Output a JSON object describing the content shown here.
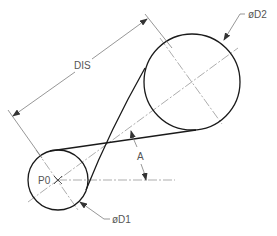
{
  "labels": {
    "distance": "DIS",
    "angle": "A",
    "origin_point": "P0",
    "small_diameter": "øD1",
    "large_diameter": "øD2"
  },
  "geometry": {
    "small_circle": {
      "cx": 58,
      "cy": 180,
      "r": 30
    },
    "large_circle": {
      "cx": 192,
      "cy": 82,
      "r": 48
    }
  },
  "colors": {
    "object_line": "#1a1a1a",
    "center_line": "#8a8a8a",
    "dimension_line": "#6a6a6a",
    "text": "#555555",
    "background": "#ffffff"
  }
}
